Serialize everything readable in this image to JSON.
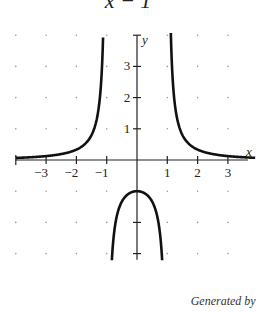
{
  "title_fragment": "x − 1",
  "credit": "Generated by Deriv",
  "chart_data": {
    "type": "line",
    "xlabel": "x",
    "ylabel": "y",
    "xlim": [
      -4,
      4
    ],
    "ylim": [
      -4,
      4
    ],
    "x_ticks": [
      -3,
      -2,
      -1,
      1,
      2,
      3
    ],
    "y_ticks": [
      1,
      2,
      3
    ],
    "grid": "dots",
    "asymptotes": {
      "vertical": [
        -1,
        1
      ],
      "horizontal": [
        0
      ]
    },
    "series": [
      {
        "name": "left branch",
        "x": [
          -4,
          -3,
          -2,
          -1.5,
          -1.2,
          -1.1
        ],
        "y": [
          0.067,
          0.125,
          0.333,
          0.8,
          2.27,
          4.76
        ]
      },
      {
        "name": "middle branch",
        "x": [
          -0.9,
          -0.7,
          -0.5,
          0,
          0.5,
          0.7,
          0.9
        ],
        "y": [
          -5.26,
          -1.96,
          -1.33,
          -1,
          -1.33,
          -1.96,
          -5.26
        ]
      },
      {
        "name": "right branch",
        "x": [
          1.1,
          1.2,
          1.5,
          2,
          3,
          4
        ],
        "y": [
          4.76,
          2.27,
          0.8,
          0.333,
          0.125,
          0.067
        ]
      }
    ]
  }
}
